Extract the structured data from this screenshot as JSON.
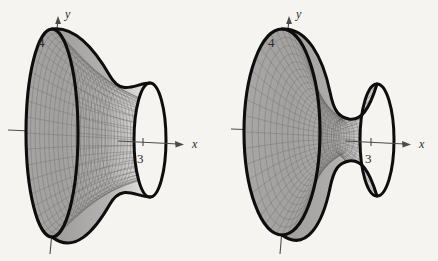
{
  "figure": {
    "kind": "two-panel-math-surface-plot",
    "background_color": "#f5f4f1",
    "ink_color": "#0d0d0d",
    "axis_color": "#4c4a48",
    "mesh_color": "#6f6d6b"
  },
  "panels": [
    {
      "id": "left",
      "name": "hyperboloid-of-one-sheet",
      "axes": {
        "y_label": "y",
        "x_label": "x",
        "y_intercept_label": "4",
        "x_intercept_label": "3"
      }
    },
    {
      "id": "right",
      "name": "hyperboloid-of-two-sheets-dumbbell",
      "axes": {
        "y_label": "y",
        "x_label": "x",
        "y_intercept_label": "4",
        "x_intercept_label": "3"
      }
    }
  ],
  "chart_data": {
    "type": "line",
    "title": "",
    "xlabel": "x",
    "ylabel": "y",
    "subplots": [
      {
        "name": "left-surface",
        "description": "Hyperboloid of one sheet shown as a shaded wireframe funnel opening to a large elliptical rim on the left and a smaller elliptical rim on the right",
        "y_intercept": 4,
        "x_intercept": 3,
        "large_rim": {
          "center_x": 52,
          "center_y": 133,
          "rx": 26,
          "ry": 104
        },
        "small_rim": {
          "center_x": 150,
          "center_y": 140,
          "rx": 16,
          "ry": 57
        },
        "axis_origin": {
          "x": 52,
          "y": 133
        }
      },
      {
        "name": "right-surface",
        "description": "Dumbbell shaped surface: a large left ellipsoidal lobe joined by a narrow neck to a smaller right ellipsoidal lobe",
        "y_intercept": 4,
        "x_intercept": 3,
        "large_rim": {
          "center_x": 63,
          "center_y": 132,
          "rx": 38,
          "ry": 103
        },
        "small_rim": {
          "center_x": 158,
          "center_y": 140,
          "rx": 17,
          "ry": 56
        },
        "neck": {
          "x": 118,
          "y": 136,
          "half_height": 17
        },
        "axis_origin": {
          "x": 63,
          "y": 132
        }
      }
    ],
    "grid": false,
    "legend": "none"
  }
}
